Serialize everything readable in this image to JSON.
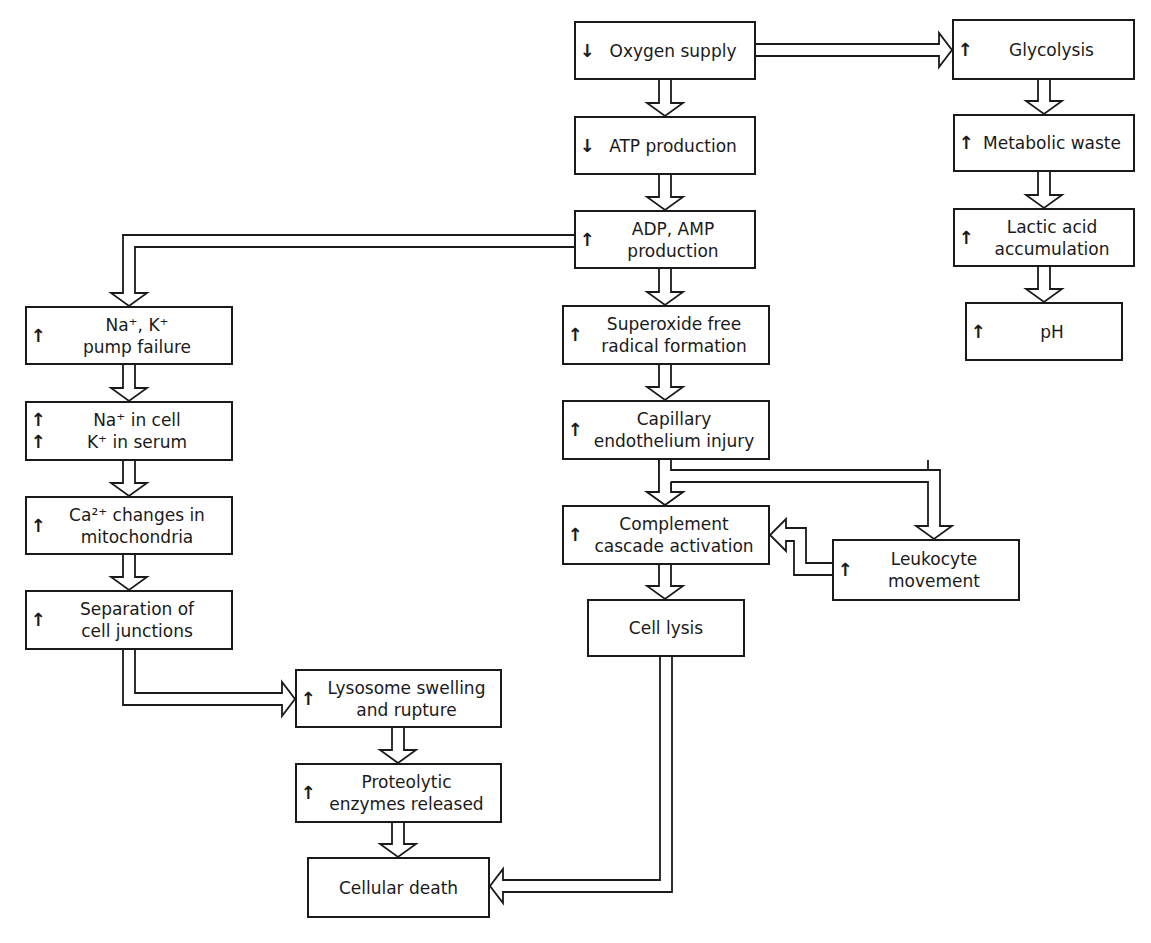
{
  "diagram": {
    "type": "flowchart",
    "topic": "Cellular ischemia cascade",
    "nodes": [
      {
        "id": "oxygen",
        "direction": "down",
        "label": "Oxygen supply",
        "x": 574,
        "y": 21,
        "w": 182,
        "h": 59
      },
      {
        "id": "atp",
        "direction": "down",
        "label": "ATP production",
        "x": 574,
        "y": 116,
        "w": 182,
        "h": 59
      },
      {
        "id": "adp",
        "direction": "up",
        "label": "ADP, AMP\nproduction",
        "x": 574,
        "y": 210,
        "w": 182,
        "h": 59
      },
      {
        "id": "superoxide",
        "direction": "up",
        "label": "Superoxide free\nradical formation",
        "x": 562,
        "y": 305,
        "w": 208,
        "h": 60
      },
      {
        "id": "capillary",
        "direction": "up",
        "label": "Capillary\nendothelium injury",
        "x": 562,
        "y": 400,
        "w": 208,
        "h": 60
      },
      {
        "id": "complement",
        "direction": "up",
        "label": "Complement\ncascade activation",
        "x": 562,
        "y": 505,
        "w": 208,
        "h": 60
      },
      {
        "id": "leukocyte",
        "direction": "up",
        "label": "Leukocyte\nmovement",
        "x": 832,
        "y": 539,
        "w": 188,
        "h": 62
      },
      {
        "id": "lysis",
        "direction": "none",
        "label": "Cell lysis",
        "x": 587,
        "y": 599,
        "w": 158,
        "h": 58
      },
      {
        "id": "glycolysis",
        "direction": "up",
        "label": "Glycolysis",
        "x": 952,
        "y": 19,
        "w": 183,
        "h": 61
      },
      {
        "id": "waste",
        "direction": "up",
        "label": "Metabolic waste",
        "x": 953,
        "y": 114,
        "w": 182,
        "h": 58
      },
      {
        "id": "lactic",
        "direction": "up",
        "label": "Lactic acid\naccumulation",
        "x": 953,
        "y": 208,
        "w": 182,
        "h": 59
      },
      {
        "id": "ph",
        "direction": "up",
        "label": "pH",
        "x": 965,
        "y": 302,
        "w": 158,
        "h": 59
      },
      {
        "id": "nak",
        "direction": "up",
        "label": "Na⁺, K⁺\npump failure",
        "x": 25,
        "y": 306,
        "w": 208,
        "h": 59
      },
      {
        "id": "nacell",
        "direction": "up-up",
        "label": "Na⁺ in cell\nK⁺ in serum",
        "x": 25,
        "y": 401,
        "w": 208,
        "h": 60
      },
      {
        "id": "calcium",
        "direction": "up",
        "label": "Ca²⁺ changes in\nmitochondria",
        "x": 25,
        "y": 496,
        "w": 208,
        "h": 59
      },
      {
        "id": "separation",
        "direction": "up",
        "label": "Separation of\ncell junctions",
        "x": 25,
        "y": 590,
        "w": 208,
        "h": 60
      },
      {
        "id": "lysosome",
        "direction": "up",
        "label": "Lysosome swelling\nand rupture",
        "x": 295,
        "y": 669,
        "w": 207,
        "h": 59
      },
      {
        "id": "proteolytic",
        "direction": "up",
        "label": "Proteolytic\nenzymes released",
        "x": 295,
        "y": 763,
        "w": 207,
        "h": 60
      },
      {
        "id": "death",
        "direction": "none",
        "label": "Cellular death",
        "x": 307,
        "y": 857,
        "w": 183,
        "h": 61
      }
    ],
    "edges": [
      {
        "from": "oxygen",
        "to": "atp"
      },
      {
        "from": "oxygen",
        "to": "glycolysis"
      },
      {
        "from": "atp",
        "to": "adp"
      },
      {
        "from": "adp",
        "to": "superoxide"
      },
      {
        "from": "adp",
        "to": "nak"
      },
      {
        "from": "superoxide",
        "to": "capillary"
      },
      {
        "from": "capillary",
        "to": "complement"
      },
      {
        "from": "capillary",
        "to": "leukocyte"
      },
      {
        "from": "leukocyte",
        "to": "complement"
      },
      {
        "from": "complement",
        "to": "lysis"
      },
      {
        "from": "lysis",
        "to": "death"
      },
      {
        "from": "glycolysis",
        "to": "waste"
      },
      {
        "from": "waste",
        "to": "lactic"
      },
      {
        "from": "lactic",
        "to": "ph"
      },
      {
        "from": "nak",
        "to": "nacell"
      },
      {
        "from": "nacell",
        "to": "calcium"
      },
      {
        "from": "calcium",
        "to": "separation"
      },
      {
        "from": "separation",
        "to": "lysosome"
      },
      {
        "from": "lysosome",
        "to": "proteolytic"
      },
      {
        "from": "proteolytic",
        "to": "death"
      }
    ],
    "glyphs": {
      "up": "↑",
      "down": "↓"
    },
    "colors": {
      "stroke": "#1a1a1a",
      "background": "#ffffff"
    }
  }
}
